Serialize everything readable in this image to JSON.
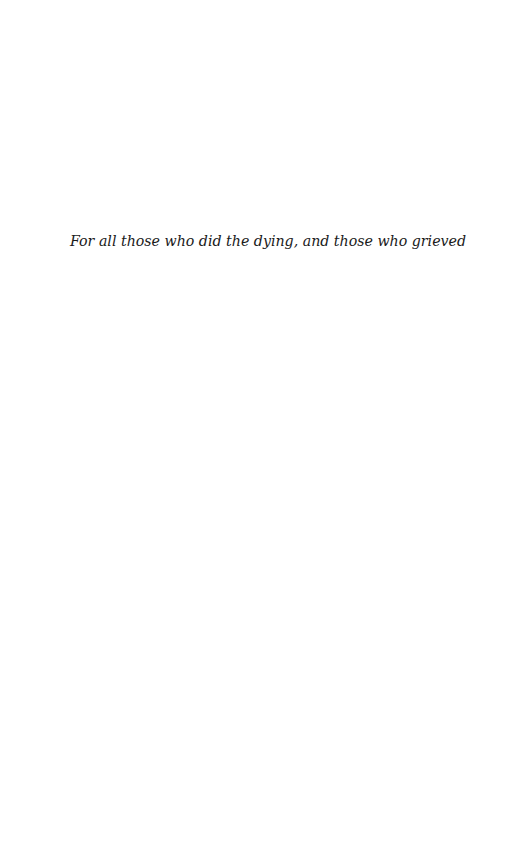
{
  "page": {
    "type": "dedication",
    "background_color": "#ffffff",
    "text_color": "#1a1a1a"
  },
  "dedication": {
    "text": "For all those who did the dying, and those who grieved"
  }
}
